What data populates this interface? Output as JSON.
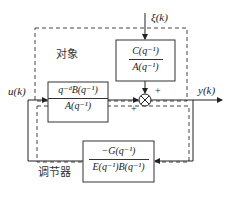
{
  "diagram": {
    "plant_label": "对象",
    "controller_label": "调节器",
    "input_label": "u(k)",
    "output_label": "y(k)",
    "disturbance_label": "ξ(k)",
    "noise_block": {
      "numerator": "C(q⁻¹)",
      "denominator": "A(q⁻¹)"
    },
    "plant_block": {
      "numerator": "q⁻ᵈB(q⁻¹)",
      "denominator": "A(q⁻¹)"
    },
    "controller_block": {
      "numerator": "−G(q⁻¹)",
      "denominator": "E(q⁻¹)B(q⁻¹)"
    },
    "sum_junction": {
      "top_sign": "+",
      "left_sign": "+"
    }
  }
}
